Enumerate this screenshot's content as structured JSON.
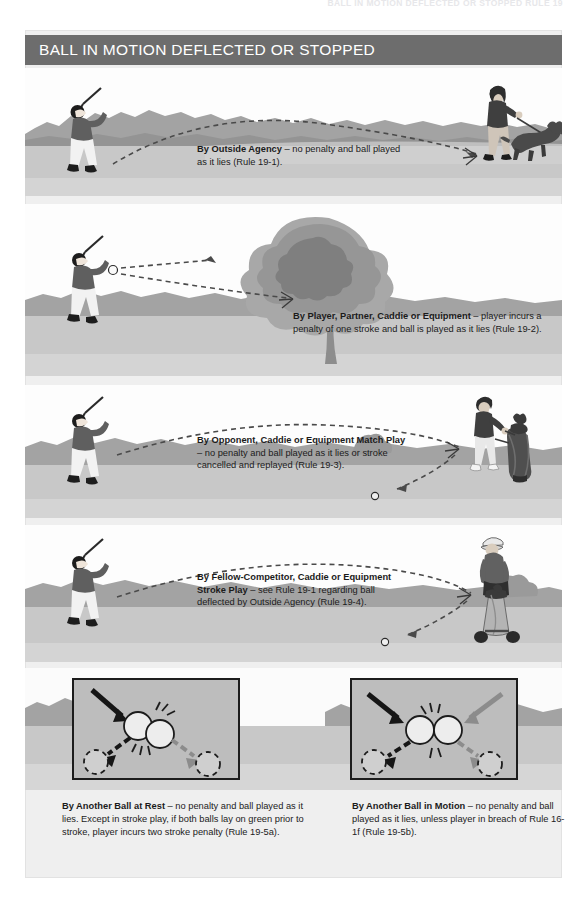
{
  "document": {
    "running_head": "BALL IN MOTION DEFLECTED OR STOPPED RULE 19",
    "title": "BALL IN MOTION DEFLECTED OR STOPPED",
    "background_color": "#efefef",
    "title_bar_color": "#6d6d6d",
    "ink_color": "#1b1b1b"
  },
  "panels": [
    {
      "id": "outside-agency",
      "caption_bold": "By Outside Agency",
      "caption_rest": " – no penalty and ball played as it lies (Rule 19-1).",
      "caption_lines": [
        "By Outside Agency – no penalty and",
        "ball played as it lies (Rule 19-1)."
      ],
      "rule": "Rule 19-1",
      "left_figure": "golfer-following-through",
      "right_figure": "person-walking-dog",
      "ball_path": "dashed-arc-to-dog"
    },
    {
      "id": "player-partner-caddie",
      "caption_bold": "By Player, Partner, Caddie or Equipment",
      "caption_rest": " – player incurs a penalty of one stroke and ball is played as it lies (Rule 19-2).",
      "caption_lines": [
        "By Player, Partner, Caddie or Equipment",
        "– player incurs a penalty of one stroke and",
        "ball is played as it lies (Rule 19-2)."
      ],
      "rule": "Rule 19-2",
      "left_figure": "golfer-following-through",
      "right_figure": "large-tree",
      "ball_path": "dashed-line-to-tree"
    },
    {
      "id": "opponent-caddie-match-play",
      "caption_bold": "By Opponent, Caddie or Equipment Match Play",
      "caption_rest": " – no penalty and ball played as it lies or stroke cancelled and replayed (Rule 19-3).",
      "caption_lines": [
        "By Opponent, Caddie or Equipment",
        "Match Play – no penalty and ball",
        "played as it lies or stroke cancelled",
        "and replayed (Rule 19-3)."
      ],
      "rule": "Rule 19-3",
      "left_figure": "golfer-following-through",
      "right_figure": "opponent-with-golf-bag",
      "ball_path": "dashed-arc-deflect-down"
    },
    {
      "id": "fellow-competitor-stroke-play",
      "caption_bold": "By Fellow-Competitor, Caddie or Equipment Stroke Play",
      "caption_rest": " – see Rule 19-1 regarding ball deflected by Outside Agency (Rule 19-4).",
      "caption_lines": [
        "By Fellow-Competitor, Caddie or",
        "Equipment Stroke Play – see Rule",
        "19-1 regarding ball deflected by",
        "Outside Agency (Rule 19-4)."
      ],
      "rule": "Rule 19-4",
      "left_figure": "golfer-following-through",
      "right_figure": "fellow-competitor-with-pull-cart",
      "ball_path": "dashed-arc-deflect-down"
    }
  ],
  "detail_boxes": [
    {
      "id": "another-ball-at-rest",
      "caption_bold": "By Another Ball at Rest",
      "caption_rest": " – no penalty and ball played as it lies. Except in stroke play, if both balls lay on green prior to stroke, player incurs two stroke penalty (Rule 19-5a).",
      "caption_lines": [
        "By Another Ball at Rest – no penalty and ball",
        "played as it lies. Except in stroke play, if both",
        "balls lay on green prior to stroke, player incurs",
        "two stroke penalty (Rule 19-5a)."
      ],
      "rule": "Rule 19-5a",
      "diagram": {
        "incoming_arrows": 1,
        "balls": 2,
        "outgoing_arrows": 2,
        "resting_positions": 2,
        "impact_marks": "radiating-lines"
      }
    },
    {
      "id": "another-ball-in-motion",
      "caption_bold": "By Another Ball in Motion",
      "caption_rest": " – no penalty and ball played as it lies, unless player in breach of Rule 16-1f (Rule 19-5b).",
      "caption_lines": [
        "By Another Ball in Motion – no penalty",
        "and ball played as it lies, unless player",
        "in breach of Rule 16-1f (Rule 19-5b)."
      ],
      "rule": "Rule 19-5b",
      "diagram": {
        "incoming_arrows": 2,
        "balls": 2,
        "outgoing_arrows": 2,
        "resting_positions": 2,
        "impact_marks": "radiating-lines"
      }
    }
  ]
}
